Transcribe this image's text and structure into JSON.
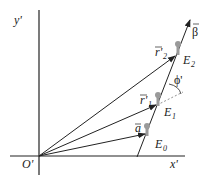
{
  "diagram": {
    "axes": {
      "x_label": "x'",
      "y_label": "y'",
      "origin_label": "O'"
    },
    "velocity_label": "β",
    "angle_label": "ϕ'",
    "vectors": [
      {
        "name": "a",
        "label": "a"
      },
      {
        "name": "r1",
        "label": "r'",
        "sub": "1"
      },
      {
        "name": "r2",
        "label": "r'",
        "sub": "2"
      }
    ],
    "events": [
      {
        "label": "E",
        "sub": "0"
      },
      {
        "label": "E",
        "sub": "1"
      },
      {
        "label": "E",
        "sub": "2"
      }
    ],
    "colors": {
      "line": "#222222",
      "marker": "#9a9a9a"
    }
  }
}
